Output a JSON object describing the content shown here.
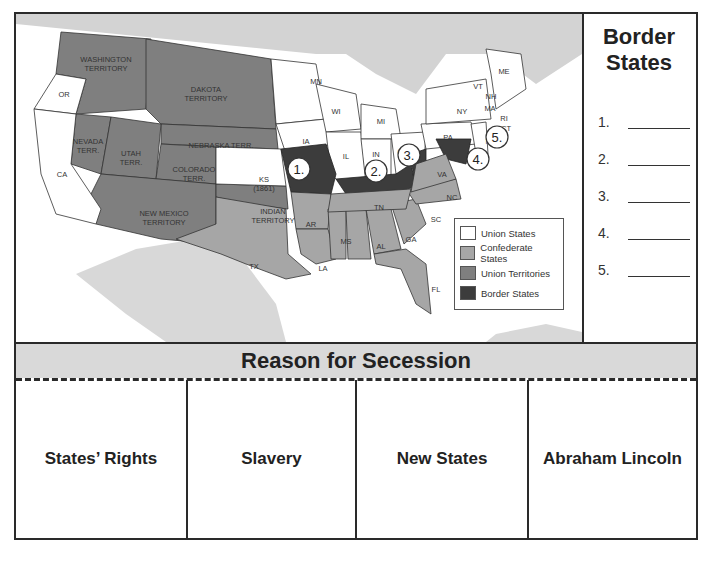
{
  "map": {
    "legend": {
      "items": [
        {
          "label": "Union States",
          "color": "#ffffff"
        },
        {
          "label": "Confederate States",
          "color": "#a6a6a6"
        },
        {
          "label": "Union Territories",
          "color": "#7f7f7f"
        },
        {
          "label": "Border States",
          "color": "#3c3c3c"
        }
      ]
    },
    "labels": {
      "washington": "WASHINGTON",
      "territory": "TERRITORY",
      "or": "OR",
      "dakota": "DAKOTA",
      "mn": "MN",
      "wi": "WI",
      "mi": "MI",
      "ny": "NY",
      "vt": "VT",
      "nh": "NH",
      "me": "ME",
      "ma": "MA",
      "ri": "RI",
      "ct": "CT",
      "nj": "NJ",
      "pa": "PA",
      "oh": "OH",
      "in": "IN",
      "il": "IL",
      "ia": "IA",
      "nebraska": "NEBRASKA TERR.",
      "nevada": "NEVADA",
      "terr": "TERR.",
      "utah": "UTAH",
      "colorado": "COLORADO",
      "ca": "CA",
      "ks": "KS",
      "ks_year": "(1861)",
      "new_mexico": "NEW MEXICO",
      "indian": "INDIAN",
      "tx": "TX",
      "ar": "AR",
      "la": "LA",
      "ms": "MS",
      "al": "AL",
      "ga": "GA",
      "fl": "FL",
      "sc": "SC",
      "nc": "NC",
      "tn": "TN",
      "va": "VA"
    },
    "markers": [
      "1.",
      "2.",
      "3.",
      "4.",
      "5."
    ]
  },
  "border_states": {
    "title_line1": "Border",
    "title_line2": "States",
    "items": [
      "1.",
      "2.",
      "3.",
      "4.",
      "5."
    ]
  },
  "secession": {
    "title": "Reason for Secession",
    "columns": [
      "States’ Rights",
      "Slavery",
      "New States",
      "Abraham Lincoln"
    ]
  }
}
